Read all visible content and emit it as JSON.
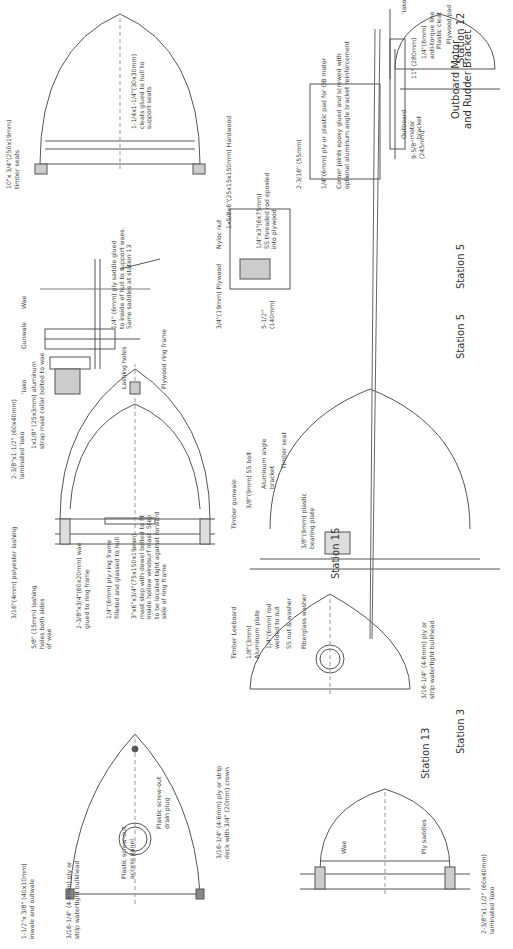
{
  "diagram": {
    "stations": [
      {
        "id": "station-3",
        "title": "Station 3",
        "labels": [
          "1-1/2\"x 3/8\" (40x10mm)\ninwale and outwale",
          "3/16-1/4\" (4-6mm) ply or\nstrip watertight bulkhead",
          "Plastic screw-out\naccess panel",
          "Plastic screw-out\ndrain plug",
          "3/16-1/4\" (4-6mm) ply or strip\ndeck with 3/4\" (20mm) crown"
        ]
      },
      {
        "id": "station-5",
        "title": "Station 5",
        "labels": [
          "3/16\"(4mm) polyester lashing",
          "5/8\" (15mm) lashing\nholes both sides\nof wae",
          "2-3/8\"x3/4\"(60x20mm) wae\nglued to ring frame",
          "1/4\"(6mm) ply ring frame\nfilleted and glassed to hull",
          "3\"x6\"x3/4\"(75x150x19mm)\nmast step with dowel bolted to fit\ninside hollow windsurf mast. Step\nto be located tight against forward\nside of ring frame",
          "2-3/8\"x1-1/2\" (60x40mm)\nlaminated 'iako",
          "1x1/8\" (25x3mm) aluminum\nstrap mast collar bolted to wae"
        ]
      },
      {
        "id": "station-5-detail",
        "title": "Station 5",
        "labels": [
          "'iako",
          "Gunwale",
          "Wae",
          "Lashing holes",
          "Plywood ring frame",
          "1/4\" (6mm) ply saddle glued\nto inside of hull to support waes.\nSame saddles at station 13"
        ]
      },
      {
        "id": "station-12",
        "title": "Station 12",
        "labels": [
          "10\"x 3/4\"(250x19mm)\ntimber seats",
          "1-1/4x1-1/4\"(30x30mm)\ncleats glued to hull to\nsupport seats"
        ]
      },
      {
        "id": "station-13",
        "title": "Station 13",
        "labels": [
          "2-3/8\"x1-1/2\" (60x40mm)\nlaminated 'iako",
          "Wae",
          "Ply saddles"
        ]
      },
      {
        "id": "station-15",
        "title": "Station 15",
        "labels": [
          "3/16-1/4\" (4-6mm) ply or\nstrip watertight bulkhead"
        ]
      },
      {
        "id": "leeboard",
        "title": "",
        "labels": [
          "Timber Leeboard",
          "1/8\"(3mm)\nAluminum plate",
          "1/4\"(6mm) rod\nwelded to nut",
          "SS nut & washer",
          "Fiberglass washer",
          "Timber gunwale",
          "3/8\"(9mm) SS bolt",
          "Aluminum angle\nbracket",
          "Timber seat",
          "3/8\"(9mm) plastic\nbearing plate"
        ]
      },
      {
        "id": "outboard",
        "title": "Outboard Motor\nand Rudder Bracket",
        "labels": [
          "3/4\"(19mm) Plywood",
          "Nyloc nut",
          "1x5/8x6\"(25x15x150mm) Hardwood",
          "1/4\"x3\"(6x75mm)\nSS threaded rod epoxied\ninto plywood",
          "5-1/2\"\n(140mm)",
          "2-3/16\" (55mm)",
          "1/4\"(6mm) ply or plastic pad for OB motor",
          "Corner joints epoxy glued and screwed with\noptional aluminum angle bracket reinforcement",
          "9-5/8\"\n(245mm)",
          "11\" (280mm)",
          "'iako",
          "Outboard\nmotor\nbracket",
          "1/4\"(6mm)\nanti-torque line",
          "Plastic cleat",
          "Plywood pad"
        ]
      }
    ]
  },
  "colors": {
    "line": "#555555",
    "hatch": "#777777"
  }
}
